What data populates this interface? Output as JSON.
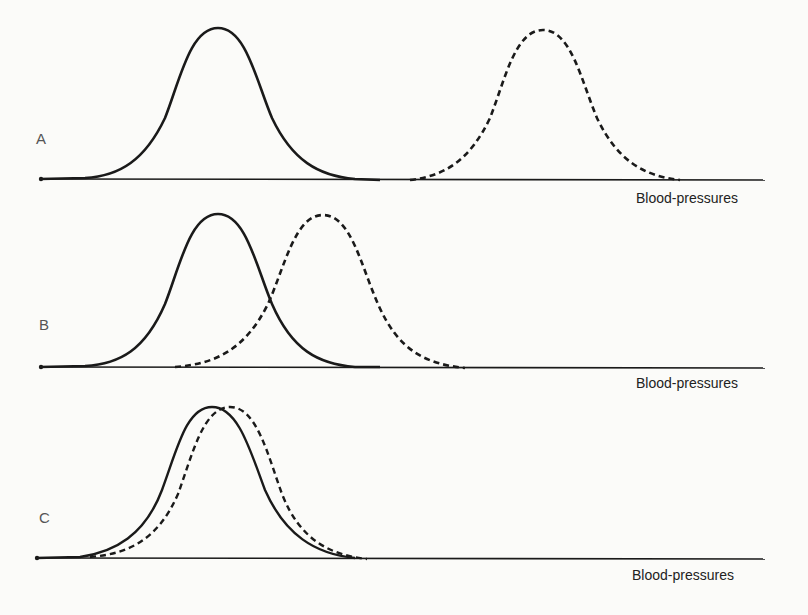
{
  "figure": {
    "panels": [
      {
        "id": "A",
        "label": "A",
        "axis_label": "Blood-pressures"
      },
      {
        "id": "B",
        "label": "B",
        "axis_label": "Blood-pressures"
      },
      {
        "id": "C",
        "label": "C",
        "axis_label": "Blood-pressures"
      }
    ],
    "legend": {
      "solid": "Distribution 1 (solid curve)",
      "dashed": "Distribution 2 (dashed curve)"
    },
    "colors": {
      "line": "#1a1a1a",
      "background": "#fbfbf9",
      "label": "#555555"
    }
  }
}
